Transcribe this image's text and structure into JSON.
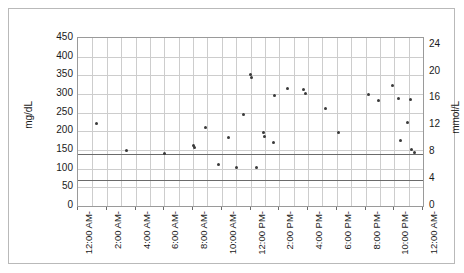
{
  "chart_data": {
    "type": "scatter",
    "title": "",
    "xlabel": "",
    "ylabel": "mg/dL",
    "y2label": "mmol/L",
    "ylim": [
      0,
      450
    ],
    "y2lim": [
      0,
      25
    ],
    "xlim": [
      0,
      24
    ],
    "grid": true,
    "legend": "none",
    "y_ticks": [
      450,
      400,
      350,
      300,
      250,
      200,
      150,
      100,
      50,
      0
    ],
    "y2_ticks": [
      24,
      20,
      16,
      12,
      8,
      4,
      0
    ],
    "x_tick_labels": [
      "12:00 AM",
      "2:00 AM",
      "4:00 AM",
      "6:00 AM",
      "8:00 AM",
      "10:00 AM",
      "12:00 PM",
      "2:00 PM",
      "4:00 PM",
      "6:00 PM",
      "8:00 PM",
      "10:00 PM",
      "12:00 AM"
    ],
    "x_tick_hours": [
      0,
      2,
      4,
      6,
      8,
      10,
      12,
      14,
      16,
      18,
      20,
      22,
      24
    ],
    "gridline_hours": [
      1,
      2,
      3,
      4,
      5,
      6,
      7,
      8,
      9,
      10,
      11,
      12,
      13,
      14,
      15,
      16,
      17,
      18,
      19,
      20,
      21,
      22,
      23
    ],
    "reference_lines": [
      {
        "name": "upper-target",
        "value": 140
      },
      {
        "name": "lower-target",
        "value": 70
      }
    ],
    "series": [
      {
        "name": "Blood Glucose",
        "color": "#3a3a3a",
        "points": [
          {
            "x": 1.3,
            "y": 221
          },
          {
            "x": 3.4,
            "y": 150
          },
          {
            "x": 6.0,
            "y": 140
          },
          {
            "x": 8.0,
            "y": 163
          },
          {
            "x": 8.1,
            "y": 157
          },
          {
            "x": 8.9,
            "y": 211
          },
          {
            "x": 9.8,
            "y": 110
          },
          {
            "x": 10.5,
            "y": 183
          },
          {
            "x": 11.0,
            "y": 104
          },
          {
            "x": 11.5,
            "y": 246
          },
          {
            "x": 12.0,
            "y": 352
          },
          {
            "x": 12.05,
            "y": 344
          },
          {
            "x": 12.4,
            "y": 104
          },
          {
            "x": 12.9,
            "y": 197
          },
          {
            "x": 13.0,
            "y": 186
          },
          {
            "x": 13.6,
            "y": 170
          },
          {
            "x": 13.7,
            "y": 295
          },
          {
            "x": 14.6,
            "y": 316
          },
          {
            "x": 15.7,
            "y": 313
          },
          {
            "x": 15.8,
            "y": 302
          },
          {
            "x": 17.2,
            "y": 260
          },
          {
            "x": 18.1,
            "y": 196
          },
          {
            "x": 20.2,
            "y": 300
          },
          {
            "x": 20.9,
            "y": 283
          },
          {
            "x": 21.9,
            "y": 323
          },
          {
            "x": 22.3,
            "y": 288
          },
          {
            "x": 22.4,
            "y": 176
          },
          {
            "x": 22.9,
            "y": 224
          },
          {
            "x": 23.1,
            "y": 285
          },
          {
            "x": 23.2,
            "y": 151
          },
          {
            "x": 23.4,
            "y": 143
          }
        ]
      }
    ]
  },
  "axes": {
    "left_title": "mg/dL",
    "right_title": "mmol/L"
  }
}
